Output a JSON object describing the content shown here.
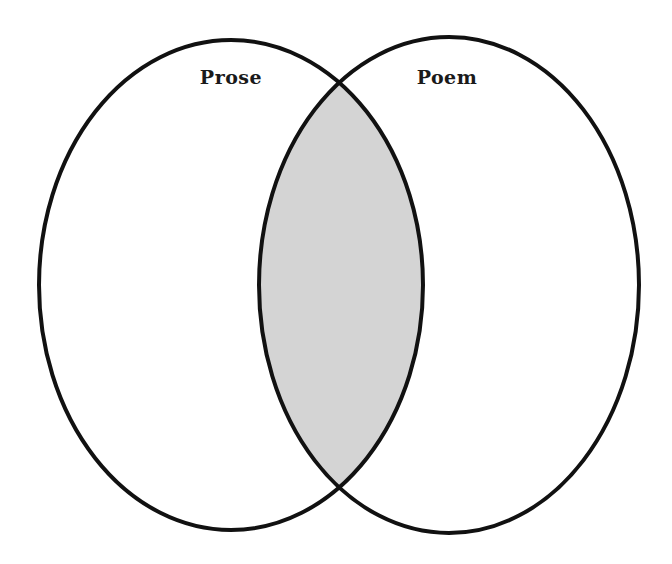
{
  "diagram": {
    "type": "venn",
    "sets": [
      {
        "label": "Prose",
        "cx": 231,
        "cy": 285,
        "rx": 192,
        "ry": 245,
        "label_x": 231,
        "label_y": 84
      },
      {
        "label": "Poem",
        "cx": 449,
        "cy": 285,
        "rx": 190,
        "ry": 248,
        "label_x": 447,
        "label_y": 84
      }
    ],
    "overlap_fill": "#d4d4d4",
    "stroke": "#111111",
    "background": "#ffffff"
  }
}
